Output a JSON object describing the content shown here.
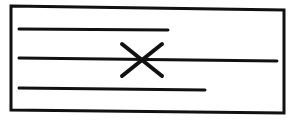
{
  "diagram": {
    "stroke_color": "#111111",
    "background": "#ffffff",
    "frame": {
      "points": "11,6 284,10 284,113 11,110"
    },
    "lines": [
      {
        "name": "line-top",
        "x1": 19,
        "y1": 29,
        "x2": 168,
        "y2": 30
      },
      {
        "name": "line-middle",
        "x1": 19,
        "y1": 58,
        "x2": 277,
        "y2": 61
      },
      {
        "name": "line-bottom",
        "x1": 19,
        "y1": 88,
        "x2": 205,
        "y2": 90
      }
    ],
    "cross": {
      "stroke1": {
        "x1": 122,
        "y1": 44,
        "x2": 162,
        "y2": 76
      },
      "stroke2": {
        "x1": 162,
        "y1": 44,
        "x2": 122,
        "y2": 76
      }
    }
  }
}
